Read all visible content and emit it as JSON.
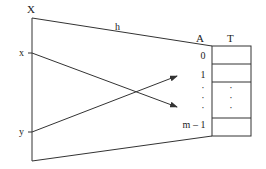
{
  "diagram": {
    "universe": {
      "label": "X"
    },
    "keys": [
      {
        "label": "x",
        "maps_to": "lower slot"
      },
      {
        "label": "y",
        "maps_to": "upper slot"
      }
    ],
    "function": {
      "label": "h"
    },
    "array": {
      "label": "A",
      "indices": [
        "0",
        "1",
        "·",
        "·",
        "·",
        "m – 1"
      ]
    },
    "table": {
      "label": "T",
      "rows": [
        "",
        "",
        "· · ·",
        ""
      ],
      "ellipsis": "·"
    },
    "colors": {
      "stroke": "#333333",
      "text": "#222222",
      "background": "#ffffff"
    }
  }
}
